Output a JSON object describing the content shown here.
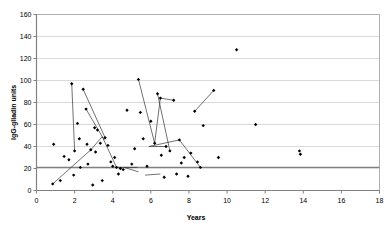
{
  "chart_data": {
    "type": "scatter",
    "title": "",
    "xlabel": "Years",
    "ylabel": "IgG-gliadin units",
    "xlim": [
      0,
      18
    ],
    "ylim": [
      0,
      160
    ],
    "xticks": [
      0,
      2,
      4,
      6,
      8,
      10,
      12,
      14,
      16,
      18
    ],
    "yticks": [
      0,
      20,
      40,
      60,
      80,
      100,
      120,
      140,
      160
    ],
    "grid": "horizontal",
    "legend": "none",
    "marker": "filled-diamond",
    "marker_color": "#000000",
    "reference_line": {
      "axis": "y",
      "value": 21,
      "color": "#808080",
      "label": ""
    },
    "series": [
      {
        "name": "IgG-gliadin antibody levels",
        "points": [
          [
            0.85,
            6
          ],
          [
            0.9,
            42
          ],
          [
            1.25,
            9
          ],
          [
            1.45,
            31
          ],
          [
            1.7,
            28
          ],
          [
            1.85,
            97
          ],
          [
            1.95,
            14
          ],
          [
            2.0,
            36
          ],
          [
            2.15,
            61
          ],
          [
            2.25,
            47
          ],
          [
            2.3,
            21
          ],
          [
            2.45,
            92
          ],
          [
            2.6,
            74
          ],
          [
            2.65,
            42
          ],
          [
            2.7,
            24
          ],
          [
            2.85,
            37
          ],
          [
            2.95,
            5
          ],
          [
            3.05,
            57
          ],
          [
            3.1,
            35
          ],
          [
            3.2,
            55
          ],
          [
            3.35,
            43
          ],
          [
            3.45,
            9
          ],
          [
            3.6,
            48
          ],
          [
            3.75,
            41
          ],
          [
            3.9,
            26
          ],
          [
            4.0,
            22
          ],
          [
            4.1,
            30
          ],
          [
            4.2,
            21
          ],
          [
            4.3,
            15
          ],
          [
            4.4,
            20
          ],
          [
            4.55,
            19
          ],
          [
            4.75,
            73
          ],
          [
            5.0,
            24
          ],
          [
            5.15,
            38
          ],
          [
            5.35,
            101
          ],
          [
            5.45,
            71
          ],
          [
            5.6,
            47
          ],
          [
            5.8,
            22
          ],
          [
            6.0,
            63
          ],
          [
            6.2,
            43
          ],
          [
            6.35,
            88
          ],
          [
            6.5,
            84
          ],
          [
            6.55,
            32
          ],
          [
            6.7,
            12
          ],
          [
            6.8,
            40
          ],
          [
            7.0,
            36
          ],
          [
            7.2,
            82
          ],
          [
            7.35,
            15
          ],
          [
            7.5,
            46
          ],
          [
            7.6,
            25
          ],
          [
            7.75,
            30
          ],
          [
            7.95,
            13
          ],
          [
            8.1,
            34
          ],
          [
            8.3,
            72
          ],
          [
            8.45,
            26
          ],
          [
            8.6,
            21
          ],
          [
            8.75,
            59
          ],
          [
            9.3,
            91
          ],
          [
            9.55,
            30
          ],
          [
            10.5,
            128
          ],
          [
            11.5,
            60
          ],
          [
            13.8,
            36
          ],
          [
            13.85,
            33
          ]
        ]
      }
    ],
    "connectors": [
      [
        [
          1.85,
          97
        ],
        [
          2.0,
          36
        ]
      ],
      [
        [
          2.45,
          92
        ],
        [
          3.6,
          48
        ]
      ],
      [
        [
          2.6,
          74
        ],
        [
          3.55,
          46
        ]
      ],
      [
        [
          0.85,
          6
        ],
        [
          2.85,
          37
        ]
      ],
      [
        [
          2.85,
          37
        ],
        [
          3.45,
          49
        ]
      ],
      [
        [
          3.45,
          49
        ],
        [
          4.2,
          21
        ]
      ],
      [
        [
          4.2,
          21
        ],
        [
          5.3,
          21
        ]
      ],
      [
        [
          5.35,
          101
        ],
        [
          6.2,
          43
        ]
      ],
      [
        [
          6.2,
          43
        ],
        [
          6.5,
          84
        ]
      ],
      [
        [
          6.5,
          84
        ],
        [
          7.2,
          82
        ]
      ],
      [
        [
          4.6,
          21
        ],
        [
          5.35,
          17
        ]
      ],
      [
        [
          5.9,
          40
        ],
        [
          6.8,
          40
        ]
      ],
      [
        [
          5.9,
          40
        ],
        [
          7.5,
          46
        ]
      ],
      [
        [
          7.5,
          46
        ],
        [
          8.6,
          21
        ]
      ],
      [
        [
          6.35,
          88
        ],
        [
          7.0,
          36
        ]
      ],
      [
        [
          8.3,
          72
        ],
        [
          9.3,
          91
        ]
      ],
      [
        [
          5.7,
          14
        ],
        [
          6.5,
          15
        ]
      ]
    ]
  }
}
